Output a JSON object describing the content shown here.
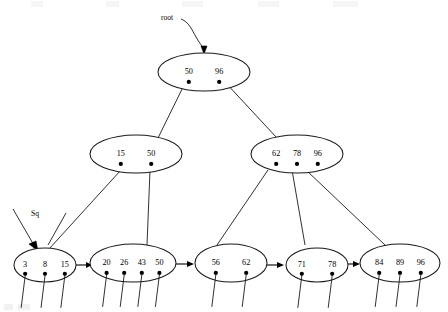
{
  "figure": {
    "type": "tree-diagram",
    "background_color": "#ffffff",
    "stroke_color": "#1a1a1a"
  },
  "annotations": {
    "root_label": "root",
    "sequence_label": "Sq"
  },
  "tree": {
    "levels": 3,
    "order": 4,
    "root": {
      "id": "root",
      "keys": [
        "50",
        "96"
      ],
      "pointer_count": 2,
      "cx": 204,
      "cy": 72,
      "rx": 46,
      "ry": 19
    },
    "internal": [
      {
        "id": "internal-left",
        "keys": [
          "15",
          "50"
        ],
        "pointer_count": 2,
        "cx": 136,
        "cy": 154,
        "rx": 46,
        "ry": 19
      },
      {
        "id": "internal-right",
        "keys": [
          "62",
          "78",
          "96"
        ],
        "pointer_count": 3,
        "cx": 297,
        "cy": 154,
        "rx": 46,
        "ry": 19
      }
    ],
    "leaves": [
      {
        "id": "leaf-1",
        "keys": [
          "3",
          "8",
          "15"
        ],
        "pointer_count": 3,
        "cx": 45,
        "cy": 265,
        "rx": 31,
        "ry": 17
      },
      {
        "id": "leaf-2",
        "keys": [
          "20",
          "26",
          "43",
          "50"
        ],
        "pointer_count": 4,
        "cx": 133,
        "cy": 263,
        "rx": 43,
        "ry": 19
      },
      {
        "id": "leaf-3",
        "keys": [
          "56",
          "62"
        ],
        "pointer_count": 2,
        "cx": 231,
        "cy": 263,
        "rx": 36,
        "ry": 19
      },
      {
        "id": "leaf-4",
        "keys": [
          "71",
          "78"
        ],
        "pointer_count": 2,
        "cx": 317,
        "cy": 265,
        "rx": 31,
        "ry": 17
      },
      {
        "id": "leaf-5",
        "keys": [
          "84",
          "89",
          "96"
        ],
        "pointer_count": 3,
        "cx": 400,
        "cy": 263,
        "rx": 40,
        "ry": 19
      }
    ],
    "sequence_links": [
      {
        "from": "leaf-1",
        "to": "leaf-2"
      },
      {
        "from": "leaf-2",
        "to": "leaf-3"
      },
      {
        "from": "leaf-3",
        "to": "leaf-4"
      },
      {
        "from": "leaf-4",
        "to": "leaf-5"
      }
    ]
  }
}
